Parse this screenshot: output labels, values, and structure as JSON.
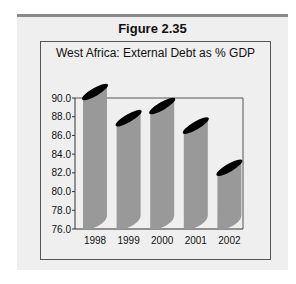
{
  "figure": {
    "label": "Figure 2.35"
  },
  "chart_data": {
    "type": "bar",
    "title": "West Africa: External Debt as % GDP",
    "categories": [
      "1998",
      "1999",
      "2000",
      "2001",
      "2002"
    ],
    "values": [
      89.9,
      87.1,
      88.4,
      86.3,
      81.8
    ],
    "xlabel": "",
    "ylabel": "",
    "ylim": [
      76.0,
      90.0
    ],
    "yticks": [
      "76.0",
      "78.0",
      "80.0",
      "82.0",
      "84.0",
      "86.0",
      "88.0",
      "90.0"
    ],
    "grid": false,
    "legend": null,
    "style": {
      "bar_color": "#999999",
      "bar_top_color": "#000000",
      "background": "#efefef"
    }
  }
}
